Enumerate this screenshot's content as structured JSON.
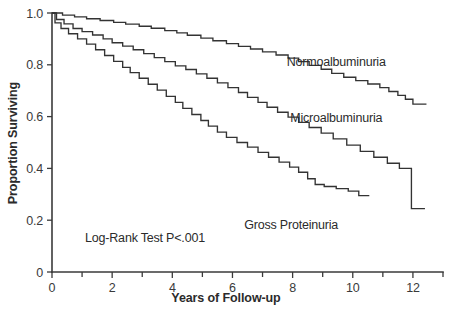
{
  "chart_data": {
    "type": "line",
    "subtype": "kaplan-meier-survival-step",
    "title": "",
    "xlabel": "Years of Follow-up",
    "ylabel": "Proportion Surviving",
    "xlim": [
      0,
      13
    ],
    "ylim": [
      0,
      1.0
    ],
    "grid": false,
    "legend_position": "inline-right-of-curve",
    "x_ticks_major": [
      0,
      2,
      4,
      6,
      8,
      10,
      12
    ],
    "x_ticks_minor": [
      1,
      3,
      5,
      7,
      9,
      11,
      13
    ],
    "x_tick_labels": [
      "0",
      "2",
      "4",
      "6",
      "8",
      "10",
      "12"
    ],
    "y_ticks": [
      0,
      0.2,
      0.4,
      0.6,
      0.8,
      1.0
    ],
    "y_tick_labels": [
      "0",
      "0.2",
      "0.4",
      "0.6",
      "0.8",
      "1.0"
    ],
    "annotations": [
      {
        "name": "log-rank-annotation",
        "text": "Log-Rank Test P<.001",
        "x": 1.1,
        "y": 0.115
      }
    ],
    "series": [
      {
        "name": "Normoalbuminuria",
        "label": "Normoalbuminuria",
        "color": "#333333",
        "label_x": 9.45,
        "label_y": 0.795,
        "points": [
          [
            0.0,
            1.0
          ],
          [
            0.35,
            1.0
          ],
          [
            0.35,
            0.992
          ],
          [
            0.75,
            0.992
          ],
          [
            0.75,
            0.985
          ],
          [
            1.15,
            0.985
          ],
          [
            1.15,
            0.978
          ],
          [
            1.6,
            0.978
          ],
          [
            1.6,
            0.971
          ],
          [
            2.05,
            0.971
          ],
          [
            2.05,
            0.964
          ],
          [
            2.45,
            0.964
          ],
          [
            2.45,
            0.957
          ],
          [
            2.9,
            0.957
          ],
          [
            2.9,
            0.949
          ],
          [
            3.3,
            0.949
          ],
          [
            3.3,
            0.941
          ],
          [
            3.75,
            0.941
          ],
          [
            3.75,
            0.932
          ],
          [
            4.15,
            0.932
          ],
          [
            4.15,
            0.923
          ],
          [
            4.5,
            0.923
          ],
          [
            4.5,
            0.914
          ],
          [
            4.95,
            0.914
          ],
          [
            4.95,
            0.903
          ],
          [
            5.35,
            0.903
          ],
          [
            5.35,
            0.893
          ],
          [
            5.8,
            0.893
          ],
          [
            5.8,
            0.882
          ],
          [
            6.2,
            0.882
          ],
          [
            6.2,
            0.871
          ],
          [
            6.6,
            0.871
          ],
          [
            6.6,
            0.861
          ],
          [
            7.0,
            0.861
          ],
          [
            7.0,
            0.85
          ],
          [
            7.45,
            0.85
          ],
          [
            7.45,
            0.838
          ],
          [
            7.85,
            0.838
          ],
          [
            7.85,
            0.826
          ],
          [
            8.2,
            0.826
          ],
          [
            8.2,
            0.812
          ],
          [
            8.55,
            0.812
          ],
          [
            8.55,
            0.798
          ],
          [
            8.95,
            0.798
          ],
          [
            8.95,
            0.783
          ],
          [
            9.3,
            0.783
          ],
          [
            9.3,
            0.767
          ],
          [
            9.7,
            0.767
          ],
          [
            9.7,
            0.752
          ],
          [
            10.1,
            0.752
          ],
          [
            10.1,
            0.739
          ],
          [
            10.5,
            0.739
          ],
          [
            10.5,
            0.726
          ],
          [
            10.9,
            0.726
          ],
          [
            10.9,
            0.712
          ],
          [
            11.2,
            0.712
          ],
          [
            11.2,
            0.697
          ],
          [
            11.5,
            0.697
          ],
          [
            11.5,
            0.682
          ],
          [
            11.75,
            0.682
          ],
          [
            11.75,
            0.667
          ],
          [
            12.0,
            0.667
          ],
          [
            12.0,
            0.648
          ],
          [
            12.45,
            0.648
          ]
        ]
      },
      {
        "name": "Microalbuminuria",
        "label": "Microalbuminuria",
        "color": "#333333",
        "label_x": 9.45,
        "label_y": 0.578,
        "points": [
          [
            0.0,
            1.0
          ],
          [
            0.15,
            1.0
          ],
          [
            0.15,
            0.975
          ],
          [
            0.4,
            0.975
          ],
          [
            0.4,
            0.958
          ],
          [
            0.7,
            0.958
          ],
          [
            0.7,
            0.94
          ],
          [
            1.0,
            0.94
          ],
          [
            1.0,
            0.928
          ],
          [
            1.35,
            0.928
          ],
          [
            1.35,
            0.915
          ],
          [
            1.7,
            0.915
          ],
          [
            1.7,
            0.9
          ],
          [
            2.0,
            0.9
          ],
          [
            2.0,
            0.885
          ],
          [
            2.35,
            0.885
          ],
          [
            2.35,
            0.872
          ],
          [
            2.7,
            0.872
          ],
          [
            2.7,
            0.858
          ],
          [
            3.05,
            0.858
          ],
          [
            3.05,
            0.843
          ],
          [
            3.4,
            0.843
          ],
          [
            3.4,
            0.828
          ],
          [
            3.75,
            0.828
          ],
          [
            3.75,
            0.812
          ],
          [
            4.1,
            0.812
          ],
          [
            4.1,
            0.796
          ],
          [
            4.45,
            0.796
          ],
          [
            4.45,
            0.782
          ],
          [
            4.8,
            0.782
          ],
          [
            4.8,
            0.765
          ],
          [
            5.15,
            0.765
          ],
          [
            5.15,
            0.748
          ],
          [
            5.5,
            0.748
          ],
          [
            5.5,
            0.73
          ],
          [
            5.85,
            0.73
          ],
          [
            5.85,
            0.712
          ],
          [
            6.2,
            0.712
          ],
          [
            6.2,
            0.693
          ],
          [
            6.5,
            0.693
          ],
          [
            6.5,
            0.674
          ],
          [
            6.85,
            0.674
          ],
          [
            6.85,
            0.655
          ],
          [
            7.15,
            0.655
          ],
          [
            7.15,
            0.636
          ],
          [
            7.5,
            0.636
          ],
          [
            7.5,
            0.617
          ],
          [
            7.85,
            0.617
          ],
          [
            7.85,
            0.598
          ],
          [
            8.2,
            0.598
          ],
          [
            8.2,
            0.578
          ],
          [
            8.55,
            0.578
          ],
          [
            8.55,
            0.558
          ],
          [
            8.95,
            0.558
          ],
          [
            8.95,
            0.536
          ],
          [
            9.35,
            0.536
          ],
          [
            9.35,
            0.514
          ],
          [
            9.8,
            0.514
          ],
          [
            9.8,
            0.49
          ],
          [
            10.25,
            0.49
          ],
          [
            10.25,
            0.466
          ],
          [
            10.7,
            0.466
          ],
          [
            10.7,
            0.443
          ],
          [
            11.15,
            0.443
          ],
          [
            11.15,
            0.42
          ],
          [
            11.55,
            0.42
          ],
          [
            11.55,
            0.4
          ],
          [
            11.95,
            0.4
          ],
          [
            11.95,
            0.245
          ],
          [
            12.4,
            0.245
          ]
        ]
      },
      {
        "name": "Gross Proteinuria",
        "label": "Gross Proteinuria",
        "color": "#333333",
        "label_x": 7.95,
        "label_y": 0.165,
        "points": [
          [
            0.0,
            1.0
          ],
          [
            0.1,
            1.0
          ],
          [
            0.1,
            0.962
          ],
          [
            0.3,
            0.962
          ],
          [
            0.3,
            0.94
          ],
          [
            0.55,
            0.94
          ],
          [
            0.55,
            0.92
          ],
          [
            0.85,
            0.92
          ],
          [
            0.85,
            0.9
          ],
          [
            1.15,
            0.9
          ],
          [
            1.15,
            0.88
          ],
          [
            1.45,
            0.88
          ],
          [
            1.45,
            0.858
          ],
          [
            1.75,
            0.858
          ],
          [
            1.75,
            0.836
          ],
          [
            2.05,
            0.836
          ],
          [
            2.05,
            0.813
          ],
          [
            2.35,
            0.813
          ],
          [
            2.35,
            0.79
          ],
          [
            2.6,
            0.79
          ],
          [
            2.6,
            0.77
          ],
          [
            2.9,
            0.77
          ],
          [
            2.9,
            0.748
          ],
          [
            3.2,
            0.748
          ],
          [
            3.2,
            0.725
          ],
          [
            3.5,
            0.725
          ],
          [
            3.5,
            0.702
          ],
          [
            3.8,
            0.702
          ],
          [
            3.8,
            0.678
          ],
          [
            4.1,
            0.678
          ],
          [
            4.1,
            0.655
          ],
          [
            4.35,
            0.655
          ],
          [
            4.35,
            0.632
          ],
          [
            4.65,
            0.632
          ],
          [
            4.65,
            0.608
          ],
          [
            4.95,
            0.608
          ],
          [
            4.95,
            0.585
          ],
          [
            5.2,
            0.585
          ],
          [
            5.2,
            0.563
          ],
          [
            5.5,
            0.563
          ],
          [
            5.5,
            0.54
          ],
          [
            5.8,
            0.54
          ],
          [
            5.8,
            0.52
          ],
          [
            6.15,
            0.52
          ],
          [
            6.15,
            0.5
          ],
          [
            6.5,
            0.5
          ],
          [
            6.5,
            0.482
          ],
          [
            6.85,
            0.482
          ],
          [
            6.85,
            0.462
          ],
          [
            7.2,
            0.462
          ],
          [
            7.2,
            0.443
          ],
          [
            7.55,
            0.443
          ],
          [
            7.55,
            0.424
          ],
          [
            7.9,
            0.424
          ],
          [
            7.9,
            0.405
          ],
          [
            8.2,
            0.405
          ],
          [
            8.2,
            0.385
          ],
          [
            8.5,
            0.385
          ],
          [
            8.5,
            0.36
          ],
          [
            8.75,
            0.36
          ],
          [
            8.75,
            0.338
          ],
          [
            9.05,
            0.338
          ],
          [
            9.05,
            0.33
          ],
          [
            9.45,
            0.33
          ],
          [
            9.45,
            0.322
          ],
          [
            9.85,
            0.322
          ],
          [
            9.85,
            0.312
          ],
          [
            10.2,
            0.312
          ],
          [
            10.2,
            0.295
          ],
          [
            10.55,
            0.295
          ]
        ]
      }
    ]
  },
  "figure": {
    "background_color": "#ffffff",
    "axis_color": "#3a3a3a",
    "curve_color": "#333333"
  }
}
